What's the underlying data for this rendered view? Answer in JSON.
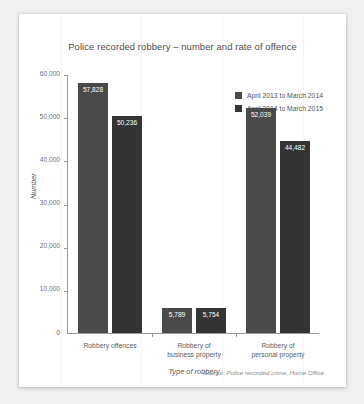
{
  "chart_data": {
    "type": "bar",
    "title": "Police recorded robbery – number and rate of offence",
    "xlabel": "Type of robbery",
    "ylabel": "Number",
    "categories": [
      "Robbery offences",
      "Robbery of business property",
      "Robbery of personal property"
    ],
    "category_lines": [
      [
        "Robbery offences"
      ],
      [
        "Robbery of",
        "business property"
      ],
      [
        "Robbery of",
        "personal property"
      ]
    ],
    "series": [
      {
        "name": "April 2013 to March 2014",
        "color": "#4a4a4a",
        "values": [
          57828,
          5789,
          52039
        ],
        "labels": [
          "57,828",
          "5,789",
          "52,039"
        ]
      },
      {
        "name": "April 2014 to March 2015",
        "color": "#343434",
        "values": [
          50236,
          5754,
          44482
        ],
        "labels": [
          "50,236",
          "5,754",
          "44,482"
        ]
      }
    ],
    "ylim": [
      0,
      60000
    ],
    "yticks": [
      0,
      10000,
      20000,
      30000,
      40000,
      50000,
      60000
    ],
    "ytick_labels": [
      "0",
      "10,000",
      "20,000",
      "30,000",
      "40,000",
      "50,000",
      "60,000"
    ],
    "grid": false,
    "legend_position": "top-right",
    "source": "Source: Police recorded crime, Home Office"
  }
}
